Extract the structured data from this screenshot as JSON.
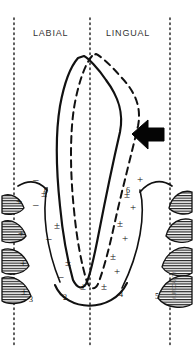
{
  "figure": {
    "background_color": "#ffffff",
    "ink_color": "#000000",
    "width": 194,
    "height": 354
  },
  "labels": {
    "labial": "LABIAL",
    "lingual": "LINGUAL"
  },
  "annotations": {
    "arrow": "left-pointing-arrow",
    "credit_text": "M. MCCARTY"
  },
  "numbers": [
    {
      "id": "n6-left",
      "text": "6",
      "x": 44,
      "y": 186
    },
    {
      "id": "n6-right",
      "text": "6",
      "x": 126,
      "y": 186
    },
    {
      "id": "n2",
      "text": "2",
      "x": 63,
      "y": 293
    },
    {
      "id": "n4",
      "text": "4",
      "x": 119,
      "y": 290
    },
    {
      "id": "n3",
      "text": "3",
      "x": 29,
      "y": 295
    },
    {
      "id": "n5",
      "text": "5",
      "x": 155,
      "y": 292
    }
  ],
  "plus_minus_marks": [
    {
      "id": "pm-l1",
      "text": "–",
      "x": 33,
      "y": 180
    },
    {
      "id": "pm-l2",
      "text": "±",
      "x": 41,
      "y": 192
    },
    {
      "id": "pm-l3",
      "text": "–",
      "x": 33,
      "y": 203
    },
    {
      "id": "pm-l4",
      "text": "±",
      "x": 54,
      "y": 224
    },
    {
      "id": "pm-l5",
      "text": "–",
      "x": 46,
      "y": 237
    },
    {
      "id": "pm-l6",
      "text": "±",
      "x": 65,
      "y": 261
    },
    {
      "id": "pm-l7",
      "text": "–",
      "x": 58,
      "y": 275
    },
    {
      "id": "pm-l8",
      "text": "±",
      "x": 80,
      "y": 285
    },
    {
      "id": "pm-r1",
      "text": "+",
      "x": 137,
      "y": 178
    },
    {
      "id": "pm-r2",
      "text": "±",
      "x": 124,
      "y": 193
    },
    {
      "id": "pm-r3",
      "text": "+",
      "x": 130,
      "y": 206
    },
    {
      "id": "pm-r4",
      "text": "±",
      "x": 117,
      "y": 222
    },
    {
      "id": "pm-r5",
      "text": "+",
      "x": 122,
      "y": 237
    },
    {
      "id": "pm-r6",
      "text": "±",
      "x": 110,
      "y": 255
    },
    {
      "id": "pm-r7",
      "text": "+",
      "x": 114,
      "y": 270
    },
    {
      "id": "pm-r8",
      "text": "±",
      "x": 101,
      "y": 285
    },
    {
      "id": "pm-f1",
      "text": "+",
      "x": 16,
      "y": 200
    },
    {
      "id": "pm-f2",
      "text": "+",
      "x": 18,
      "y": 232
    },
    {
      "id": "pm-f3",
      "text": "+",
      "x": 20,
      "y": 262
    },
    {
      "id": "pm-f4",
      "text": "±",
      "x": 21,
      "y": 290
    }
  ],
  "guide_lines": [
    {
      "id": "guide-left",
      "x": 14
    },
    {
      "id": "guide-center",
      "x": 90
    },
    {
      "id": "guide-right",
      "x": 170
    }
  ]
}
